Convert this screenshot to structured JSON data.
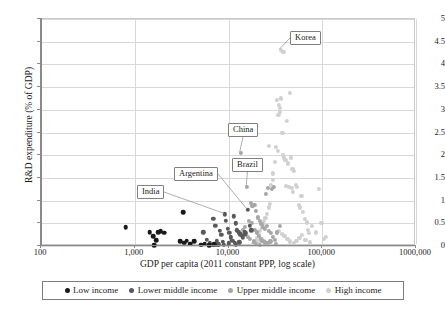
{
  "chart_data": {
    "type": "scatter",
    "title": "",
    "xlabel": "GDP per capita (2011 constant PPP, log scale)",
    "ylabel": "R&D expenditure (% of GDP)",
    "xscale": "log",
    "xlim": [
      100,
      1000000
    ],
    "ylim": [
      0,
      5
    ],
    "xticks": [
      100,
      1000,
      10000,
      100000,
      1000000
    ],
    "xtick_labels": [
      "100",
      "1,000",
      "10,000",
      "100,000",
      "1000,000"
    ],
    "yticks": [
      0,
      0.5,
      1,
      1.5,
      2,
      2.5,
      3,
      3.5,
      4,
      4.5,
      5
    ],
    "ytick_labels": [
      "0",
      "0.5",
      "1",
      "1.5",
      "2",
      "2.5",
      "3",
      "3.5",
      "4",
      "4.5",
      "5"
    ],
    "grid": "horizontal-and-vertical",
    "legend_position": "below-axis",
    "colors": {
      "low_income": "#1a1a1a",
      "lower_middle_income": "#595959",
      "upper_middle_income": "#a6a6a6",
      "high_income": "#d0d0d0",
      "gridline": "#d8d8d8",
      "axis": "#8a8a8a",
      "text": "#1c1c1c"
    },
    "series": [
      {
        "name": "Low income",
        "color": "#1a1a1a",
        "points": [
          [
            800,
            0.41
          ],
          [
            1450,
            0.3
          ],
          [
            1580,
            0.22
          ],
          [
            1700,
            0.13
          ],
          [
            1620,
            0.02
          ],
          [
            1900,
            0.33
          ],
          [
            2050,
            0.29
          ],
          [
            1780,
            0.31
          ],
          [
            3300,
            0.75
          ],
          [
            3050,
            0.1
          ],
          [
            3350,
            0.07
          ],
          [
            3600,
            0.12
          ],
          [
            3900,
            0.05
          ],
          [
            4300,
            0.1
          ],
          [
            5100,
            0.03
          ],
          [
            5600,
            0.05
          ],
          [
            6200,
            0.02
          ],
          [
            7000,
            0.04
          ]
        ]
      },
      {
        "name": "Lower middle income",
        "color": "#595959",
        "points": [
          [
            5400,
            0.3
          ],
          [
            5900,
            0.14
          ],
          [
            6300,
            0.06
          ],
          [
            6900,
            0.6
          ],
          [
            7200,
            0.45
          ],
          [
            7500,
            0.11
          ],
          [
            7800,
            0.04
          ],
          [
            8100,
            0.33
          ],
          [
            8400,
            0.25
          ],
          [
            8700,
            0.09
          ],
          [
            9100,
            0.7
          ],
          [
            9400,
            0.55
          ],
          [
            9800,
            0.38
          ],
          [
            10200,
            0.29
          ],
          [
            10600,
            0.19
          ],
          [
            11000,
            0.12
          ],
          [
            11400,
            0.65
          ],
          [
            11900,
            0.5
          ],
          [
            12300,
            0.35
          ],
          [
            12800,
            0.3
          ],
          [
            13300,
            0.26
          ],
          [
            13800,
            0.22
          ],
          [
            14300,
            0.18
          ],
          [
            14900,
            0.3
          ],
          [
            15400,
            0.28
          ],
          [
            16000,
            0.8
          ],
          [
            15000,
            0.25
          ],
          [
            13000,
            0.08
          ],
          [
            11700,
            0.07
          ],
          [
            10000,
            0.06
          ],
          [
            8900,
            0.03
          ],
          [
            7600,
            0.02
          ],
          [
            16800,
            0.45
          ],
          [
            17500,
            0.35
          ],
          [
            6600,
            0.02
          ],
          [
            12000,
            0.03
          ]
        ]
      },
      {
        "name": "Upper middle income",
        "color": "#a6a6a6",
        "points": [
          [
            13500,
            2.05
          ],
          [
            15800,
            1.3
          ],
          [
            17200,
            0.95
          ],
          [
            18000,
            0.88
          ],
          [
            18900,
            0.9
          ],
          [
            19800,
            0.78
          ],
          [
            20600,
            0.63
          ],
          [
            21500,
            0.55
          ],
          [
            22400,
            0.48
          ],
          [
            23500,
            0.42
          ],
          [
            24600,
            0.37
          ],
          [
            25800,
            0.45
          ],
          [
            27000,
            0.33
          ],
          [
            28400,
            0.28
          ],
          [
            17800,
            0.5
          ],
          [
            16500,
            0.55
          ],
          [
            19000,
            0.35
          ],
          [
            20000,
            0.3
          ],
          [
            21000,
            0.22
          ],
          [
            22000,
            0.16
          ],
          [
            23000,
            0.12
          ],
          [
            24500,
            0.08
          ],
          [
            26000,
            0.06
          ],
          [
            28000,
            0.1
          ],
          [
            30000,
            0.2
          ],
          [
            31500,
            0.14
          ],
          [
            15000,
            0.42
          ],
          [
            14200,
            0.35
          ],
          [
            16000,
            0.2
          ],
          [
            17000,
            0.15
          ],
          [
            18500,
            0.1
          ],
          [
            19500,
            0.05
          ],
          [
            33000,
            0.3
          ],
          [
            35000,
            0.45
          ],
          [
            29000,
            1.25
          ],
          [
            30500,
            1.3
          ],
          [
            26500,
            1.28
          ],
          [
            25000,
            1.15
          ],
          [
            32000,
            0.05
          ],
          [
            21800,
            0.03
          ]
        ]
      },
      {
        "name": "High income",
        "color": "#d0d0d0",
        "points": [
          [
            36000,
            4.32
          ],
          [
            38500,
            4.28
          ],
          [
            45000,
            3.37
          ],
          [
            33000,
            3.22
          ],
          [
            36500,
            3.25
          ],
          [
            34500,
            3.1
          ],
          [
            35500,
            3.05
          ],
          [
            35000,
            2.95
          ],
          [
            34000,
            2.88
          ],
          [
            42000,
            2.75
          ],
          [
            37500,
            2.5
          ],
          [
            33500,
            2.1
          ],
          [
            38000,
            2.0
          ],
          [
            39000,
            1.95
          ],
          [
            40500,
            1.9
          ],
          [
            43000,
            1.82
          ],
          [
            46000,
            1.95
          ],
          [
            48000,
            1.7
          ],
          [
            50000,
            1.65
          ],
          [
            52000,
            1.35
          ],
          [
            54000,
            1.3
          ],
          [
            44000,
            1.3
          ],
          [
            41000,
            1.32
          ],
          [
            47000,
            1.28
          ],
          [
            49000,
            1.2
          ],
          [
            56000,
            0.9
          ],
          [
            58000,
            0.85
          ],
          [
            60000,
            1.1
          ],
          [
            62000,
            0.75
          ],
          [
            65000,
            0.6
          ],
          [
            68000,
            0.52
          ],
          [
            70000,
            0.35
          ],
          [
            72000,
            0.28
          ],
          [
            78000,
            0.45
          ],
          [
            85000,
            0.3
          ],
          [
            92000,
            1.26
          ],
          [
            98000,
            0.5
          ],
          [
            105000,
            0.15
          ],
          [
            110000,
            0.2
          ],
          [
            31000,
            1.85
          ],
          [
            30000,
            1.6
          ],
          [
            29500,
            1.45
          ],
          [
            28500,
            1.35
          ],
          [
            27500,
            0.92
          ],
          [
            26800,
            0.85
          ],
          [
            25500,
            0.7
          ],
          [
            24800,
            0.62
          ],
          [
            24000,
            0.55
          ],
          [
            23200,
            0.48
          ],
          [
            22500,
            0.4
          ],
          [
            21700,
            0.33
          ],
          [
            20900,
            0.25
          ],
          [
            20200,
            0.18
          ],
          [
            19600,
            0.12
          ],
          [
            19000,
            0.08
          ],
          [
            18300,
            0.04
          ],
          [
            27000,
            2.2
          ],
          [
            31800,
            2.18
          ],
          [
            34800,
            0.33
          ],
          [
            36800,
            0.27
          ],
          [
            39500,
            0.22
          ],
          [
            42500,
            0.16
          ],
          [
            45500,
            0.1
          ],
          [
            49500,
            0.06
          ],
          [
            53000,
            0.12
          ],
          [
            57000,
            0.18
          ],
          [
            61000,
            0.24
          ],
          [
            66000,
            0.14
          ],
          [
            74000,
            0.08
          ],
          [
            25200,
            0.05
          ],
          [
            23800,
            0.1
          ],
          [
            22800,
            0.15
          ],
          [
            21200,
            0.1
          ]
        ]
      }
    ],
    "annotations": [
      {
        "label": "Korea",
        "value_x": 36000,
        "value_y": 4.32
      },
      {
        "label": "China",
        "value_x": 13500,
        "value_y": 2.05
      },
      {
        "label": "Brazil",
        "value_x": 15800,
        "value_y": 1.3
      },
      {
        "label": "Argentina",
        "value_x": 16000,
        "value_y": 0.8
      },
      {
        "label": "India",
        "value_x": 9100,
        "value_y": 0.7
      }
    ]
  },
  "legend": {
    "items": [
      {
        "label": "Low income",
        "color": "#1a1a1a",
        "size": 5.0
      },
      {
        "label": "Lower middle income",
        "color": "#595959",
        "size": 5.0
      },
      {
        "label": "Upper middle income",
        "color": "#a6a6a6",
        "size": 5.0
      },
      {
        "label": "High income",
        "color": "#d0d0d0",
        "size": 5.0
      }
    ]
  }
}
